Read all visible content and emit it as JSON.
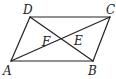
{
  "figure": {
    "type": "parallelogram-with-diagonals",
    "stroke_color": "#222222",
    "background": "#ffffff",
    "points": {
      "A": {
        "x": 11,
        "y": 61
      },
      "B": {
        "x": 93,
        "y": 61
      },
      "C": {
        "x": 110,
        "y": 17
      },
      "D": {
        "x": 30,
        "y": 17
      }
    },
    "segments": [
      {
        "name": "AB",
        "from": "A",
        "to": "B"
      },
      {
        "name": "BC",
        "from": "B",
        "to": "C"
      },
      {
        "name": "CD",
        "from": "C",
        "to": "D"
      },
      {
        "name": "DA",
        "from": "D",
        "to": "A"
      },
      {
        "name": "AC",
        "from": "A",
        "to": "C"
      },
      {
        "name": "DB",
        "from": "D",
        "to": "B"
      }
    ],
    "labels": {
      "A": "A",
      "B": "B",
      "C": "C",
      "D": "D",
      "E": "E",
      "F": "F"
    }
  }
}
